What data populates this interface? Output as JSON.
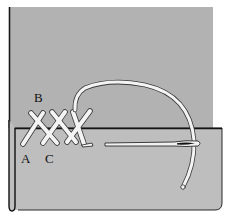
{
  "illustration": {
    "subject": "hem catch stitch (herringbone stitch) with needle and thread",
    "labels": {
      "a": "A",
      "b": "B",
      "c": "C"
    },
    "colors": {
      "background": "#ffffff",
      "fabric_back": "#b2b2b2",
      "fabric_hem": "#bebebe",
      "outline": "#1a1a1a",
      "thread": "#f4f4f4",
      "needle": "#f2f2f2",
      "needle_eye": "#111111"
    },
    "stitch_count": 3
  }
}
